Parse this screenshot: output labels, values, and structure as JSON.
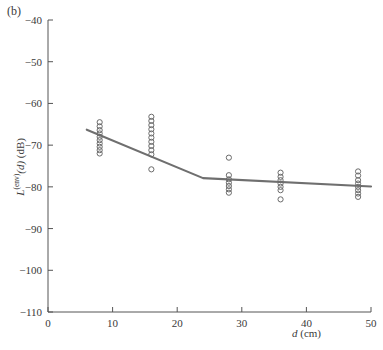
{
  "figure": {
    "panel_label": "(b)",
    "axis_line_color": "#555555",
    "marker_color": "#6b6b6b",
    "fit_line_color": "#6f6f6f",
    "background": "#ffffff"
  },
  "chart_data": {
    "type": "scatter",
    "title": "",
    "subtitle": "",
    "panel": "(b)",
    "xlabel": "d (cm)",
    "xlabel_parts": {
      "symbol": "d",
      "unit": "(cm)"
    },
    "ylabel": "L(env)(d) (dB)",
    "ylabel_parts": {
      "symbol": "L",
      "superscript": "(env)",
      "argument": "(d)",
      "unit": "(dB)"
    },
    "xlim": [
      0,
      50
    ],
    "ylim": [
      -110,
      -40
    ],
    "xticks": [
      0,
      10,
      20,
      30,
      40,
      50
    ],
    "yticks": [
      -40,
      -50,
      -60,
      -70,
      -80,
      -90,
      -100,
      -110
    ],
    "xtick_labels": [
      "0",
      "10",
      "20",
      "30",
      "40",
      "50"
    ],
    "ytick_labels": [
      "-40",
      "-50",
      "-60",
      "-70",
      "-80",
      "-90",
      "-100",
      "-110"
    ],
    "grid": false,
    "legend": null,
    "marker_style": "open-circle",
    "series": [
      {
        "name": "measurements",
        "type": "scatter",
        "points": [
          {
            "x": 8,
            "y": -64.5
          },
          {
            "x": 8,
            "y": -65.5
          },
          {
            "x": 8,
            "y": -66.4
          },
          {
            "x": 8,
            "y": -67.2
          },
          {
            "x": 8,
            "y": -68.0
          },
          {
            "x": 8,
            "y": -68.8
          },
          {
            "x": 8,
            "y": -69.6
          },
          {
            "x": 8,
            "y": -70.4
          },
          {
            "x": 8,
            "y": -71.2
          },
          {
            "x": 8,
            "y": -72.0
          },
          {
            "x": 16,
            "y": -63.2
          },
          {
            "x": 16,
            "y": -64.2
          },
          {
            "x": 16,
            "y": -65.2
          },
          {
            "x": 16,
            "y": -66.2
          },
          {
            "x": 16,
            "y": -67.2
          },
          {
            "x": 16,
            "y": -68.2
          },
          {
            "x": 16,
            "y": -69.2
          },
          {
            "x": 16,
            "y": -70.2
          },
          {
            "x": 16,
            "y": -71.2
          },
          {
            "x": 16,
            "y": -72.2
          },
          {
            "x": 16,
            "y": -75.8
          },
          {
            "x": 28,
            "y": -73.0
          },
          {
            "x": 28,
            "y": -77.2
          },
          {
            "x": 28,
            "y": -78.2
          },
          {
            "x": 28,
            "y": -79.0
          },
          {
            "x": 28,
            "y": -79.8
          },
          {
            "x": 28,
            "y": -80.6
          },
          {
            "x": 28,
            "y": -81.4
          },
          {
            "x": 36,
            "y": -76.6
          },
          {
            "x": 36,
            "y": -77.6
          },
          {
            "x": 36,
            "y": -78.4
          },
          {
            "x": 36,
            "y": -79.2
          },
          {
            "x": 36,
            "y": -80.0
          },
          {
            "x": 36,
            "y": -80.8
          },
          {
            "x": 36,
            "y": -83.0
          },
          {
            "x": 48,
            "y": -76.3
          },
          {
            "x": 48,
            "y": -77.3
          },
          {
            "x": 48,
            "y": -78.4
          },
          {
            "x": 48,
            "y": -79.2
          },
          {
            "x": 48,
            "y": -80.0
          },
          {
            "x": 48,
            "y": -80.8
          },
          {
            "x": 48,
            "y": -81.6
          },
          {
            "x": 48,
            "y": -82.4
          }
        ]
      },
      {
        "name": "piecewise-linear-fit",
        "type": "line",
        "points": [
          {
            "x": 6.0,
            "y": -66.3
          },
          {
            "x": 24.0,
            "y": -77.9
          },
          {
            "x": 50.0,
            "y": -79.9
          }
        ]
      }
    ]
  }
}
